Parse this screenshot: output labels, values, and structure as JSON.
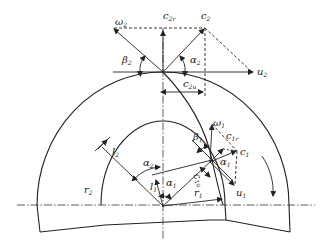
{
  "diagram": {
    "labels": {
      "w2": {
        "main": "ω",
        "sub": "2"
      },
      "c2r": {
        "main": "c",
        "sub": "2r"
      },
      "c2": {
        "main": "c",
        "sub": "2"
      },
      "beta2": {
        "main": "β",
        "sub": "2"
      },
      "alpha2_top": {
        "main": "α",
        "sub": "2"
      },
      "u2": {
        "main": "u",
        "sub": "2"
      },
      "c2u": {
        "main": "c",
        "sub": "2u"
      },
      "w1": {
        "main": "ω",
        "sub": "1"
      },
      "beta1": {
        "main": "β",
        "sub": "1"
      },
      "c1r": {
        "main": "c",
        "sub": "1r"
      },
      "c1": {
        "main": "c",
        "sub": "1"
      },
      "alpha1_right": {
        "main": "α",
        "sub": "1"
      },
      "c1u": {
        "main": "c",
        "sub": "1u"
      },
      "u1": {
        "main": "u",
        "sub": "1"
      },
      "l2": {
        "main": "l",
        "sub": "2"
      },
      "alpha2_center": {
        "main": "α",
        "sub": "2"
      },
      "l1": {
        "main": "l",
        "sub": "1"
      },
      "alpha1_center": {
        "main": "α",
        "sub": "1"
      },
      "r2": {
        "main": "r",
        "sub": "2"
      },
      "r1": {
        "main": "r",
        "sub": "1"
      }
    },
    "colors": {
      "line": "#222222",
      "background": "#ffffff"
    }
  }
}
